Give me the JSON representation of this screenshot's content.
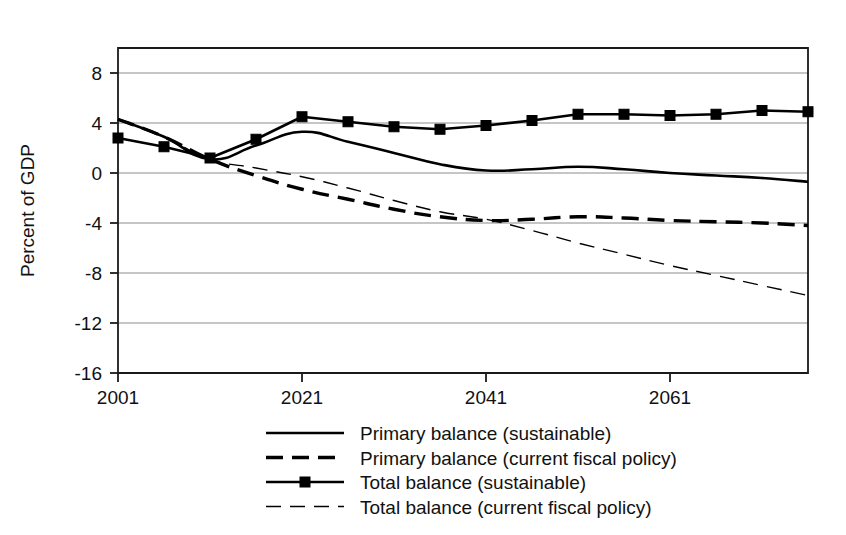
{
  "chart_data": {
    "type": "line",
    "title": "",
    "xlabel": "",
    "ylabel": "Percent of GDP",
    "xlim": [
      2001,
      2076
    ],
    "ylim": [
      -16,
      10
    ],
    "grid": true,
    "legend_position": "bottom",
    "x_ticks": [
      "2001",
      "2021",
      "2041",
      "2061"
    ],
    "x_tick_values": [
      2001,
      2021,
      2041,
      2061
    ],
    "y_ticks": [
      "8",
      "4",
      "0",
      "-4",
      "-8",
      "-12",
      "-16"
    ],
    "y_tick_values": [
      8,
      4,
      0,
      -4,
      -8,
      -12,
      -16
    ],
    "x": [
      2001,
      2006,
      2011,
      2016,
      2021,
      2026,
      2031,
      2036,
      2041,
      2046,
      2051,
      2056,
      2061,
      2066,
      2071,
      2076
    ],
    "series": [
      {
        "name": "Primary balance (sustainable)",
        "style": "solid",
        "width": 2.6,
        "marker": "none",
        "values": [
          4.3,
          2.9,
          1.1,
          2.2,
          3.3,
          2.5,
          1.6,
          0.7,
          0.2,
          0.3,
          0.5,
          0.3,
          0.0,
          -0.2,
          -0.4,
          -0.7
        ]
      },
      {
        "name": "Primary balance (current fiscal policy)",
        "style": "dashed",
        "width": 3.4,
        "marker": "none",
        "values": [
          4.3,
          2.9,
          1.1,
          -0.2,
          -1.3,
          -2.1,
          -2.9,
          -3.5,
          -3.8,
          -3.7,
          -3.5,
          -3.6,
          -3.8,
          -3.9,
          -4.0,
          -4.2
        ]
      },
      {
        "name": "Total balance (sustainable)",
        "style": "solid",
        "width": 2.6,
        "marker": "square",
        "values": [
          2.8,
          2.1,
          1.2,
          2.7,
          4.5,
          4.1,
          3.7,
          3.5,
          3.8,
          4.2,
          4.7,
          4.7,
          4.6,
          4.7,
          5.0,
          4.9
        ]
      },
      {
        "name": "Total balance (current fiscal policy)",
        "style": "dashed-thin",
        "width": 1.4,
        "marker": "none",
        "values": [
          4.3,
          2.9,
          1.1,
          0.4,
          -0.3,
          -1.2,
          -2.2,
          -3.1,
          -3.7,
          -4.6,
          -5.6,
          -6.5,
          -7.4,
          -8.2,
          -9.0,
          -9.8
        ]
      }
    ],
    "legend": [
      {
        "label": "Primary balance (sustainable)",
        "style": "solid",
        "width": 2.6,
        "marker": "none"
      },
      {
        "label": "Primary balance (current fiscal policy)",
        "style": "dashed",
        "width": 3.4,
        "marker": "none"
      },
      {
        "label": "Total balance (sustainable)",
        "style": "solid",
        "width": 2.6,
        "marker": "square"
      },
      {
        "label": "Total balance (current fiscal policy)",
        "style": "dashed-thin",
        "width": 1.4,
        "marker": "none"
      }
    ],
    "colors": {
      "series": "#000000",
      "grid": "#8c8c8c",
      "axis": "#1a1a1a",
      "background": "#ffffff"
    }
  }
}
